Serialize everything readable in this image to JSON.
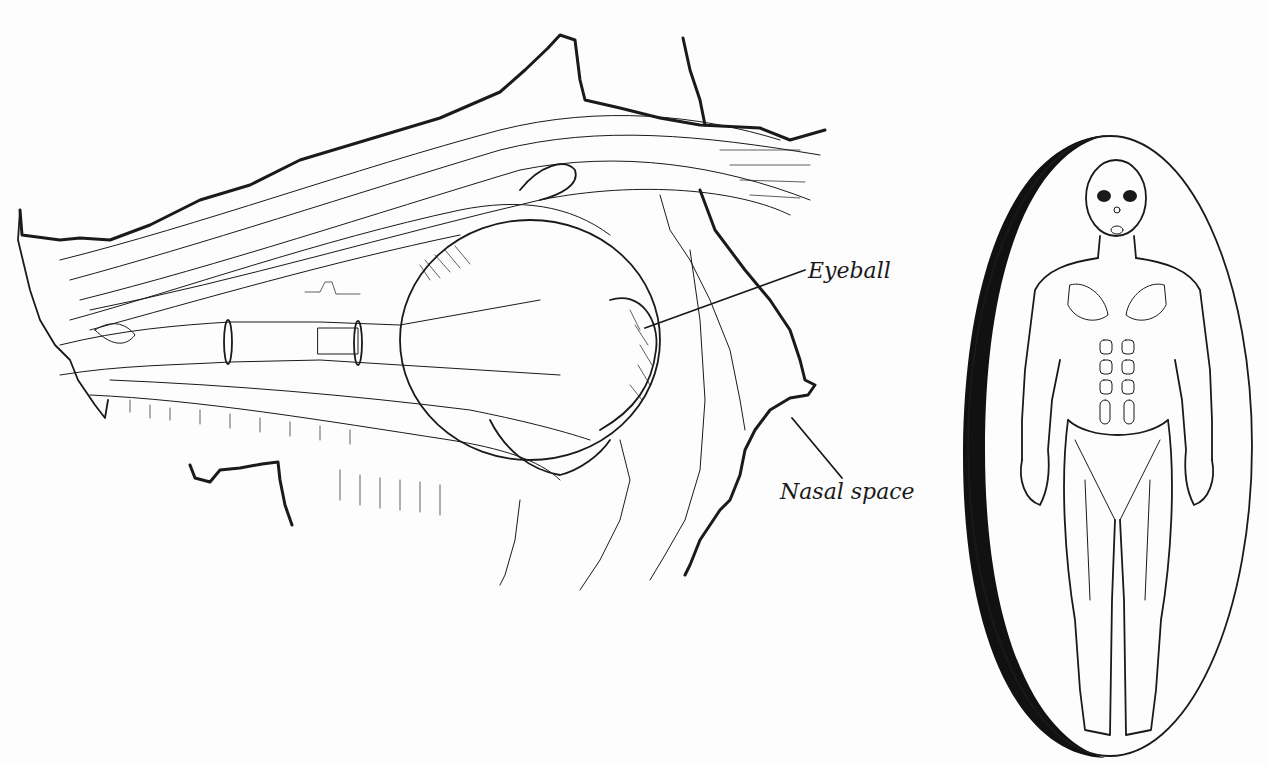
{
  "figure": {
    "type": "anatomical-illustration",
    "labels": {
      "eyeball": "Eyeball",
      "nasal_space": "Nasal space"
    },
    "inset": {
      "subject": "Full-body anterior view of human musculature",
      "frame": "oval with heavy left-edge shadow"
    },
    "colors": {
      "ink": "#1a1a1a",
      "paper": "#fdfdfd"
    }
  }
}
